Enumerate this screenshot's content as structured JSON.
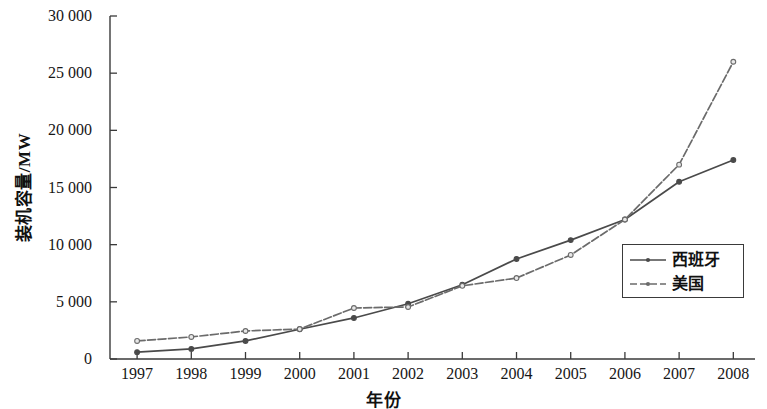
{
  "chart_data": {
    "type": "line",
    "title": "",
    "xlabel": "年份",
    "ylabel": "装机容量/MW",
    "x": [
      1997,
      1998,
      1999,
      2000,
      2001,
      2002,
      2003,
      2004,
      2005,
      2006,
      2007,
      2008
    ],
    "categories": [
      "1997",
      "1998",
      "1999",
      "2000",
      "2001",
      "2002",
      "2003",
      "2004",
      "2005",
      "2006",
      "2007",
      "2008"
    ],
    "series": [
      {
        "name": "西班牙",
        "style": "solid",
        "color": "#4a4a4a",
        "values": [
          600,
          880,
          1580,
          2600,
          3590,
          4830,
          6500,
          8750,
          10400,
          12200,
          15500,
          17400
        ]
      },
      {
        "name": "美国",
        "style": "dashed",
        "color": "#6b6b6b",
        "values": [
          1580,
          1930,
          2450,
          2620,
          4460,
          4550,
          6400,
          7080,
          9100,
          12200,
          17000,
          26000
        ]
      }
    ],
    "xlim": [
      1996.5,
      2008.4
    ],
    "ylim": [
      0,
      30000
    ],
    "yticks": [
      0,
      5000,
      10000,
      15000,
      20000,
      25000,
      30000
    ],
    "ytick_labels": [
      "0",
      "5 000",
      "10 000",
      "15 000",
      "20 000",
      "25 000",
      "30 000"
    ],
    "xticks": [
      1997,
      1998,
      1999,
      2000,
      2001,
      2002,
      2003,
      2004,
      2005,
      2006,
      2007,
      2008
    ],
    "grid": false,
    "legend_position": "lower-right",
    "legend_entries": [
      "西班牙",
      "美国"
    ],
    "axis_color": "#3a3a3a"
  }
}
